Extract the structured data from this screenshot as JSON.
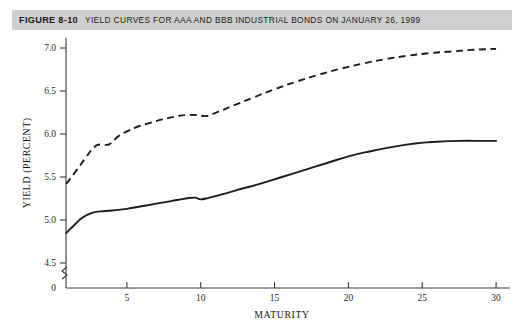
{
  "figure": {
    "number_label": "FIGURE 8-10",
    "caption": "Yield Curves for AAA and BBB Industrial Bonds on January 26, 1999",
    "band_color": "#cfcfcf",
    "background_color": "#ffffff"
  },
  "chart_data": {
    "type": "line",
    "title": "Yield Curves for AAA and BBB Industrial Bonds on January 26, 1999",
    "xlabel": "MATURITY",
    "ylabel": "YIELD (PERCENT)",
    "xlim": [
      0,
      30.6
    ],
    "ylim": [
      4.28,
      7.12
    ],
    "grid": false,
    "legend": "none",
    "axis_break": true,
    "axis_break_note": "y-axis broken between 0 and 4.5",
    "xticks": [
      5,
      10,
      15,
      20,
      25,
      30
    ],
    "xtick_labels": [
      "5",
      "10",
      "15",
      "20",
      "25",
      "30"
    ],
    "yticks": [
      4.5,
      5.0,
      5.5,
      6.0,
      6.5,
      7.0
    ],
    "ytick_labels": [
      "4.5",
      "5.0",
      "5.5",
      "6.0",
      "6.5",
      "7.0"
    ],
    "y_origin_label": "0",
    "series": [
      {
        "name": "AAA Industrial Bonds",
        "style": "solid",
        "color": "#1c1c1c",
        "x": [
          0.9,
          1.5,
          2.0,
          2.6,
          3.2,
          4.0,
          5.0,
          6.0,
          7.0,
          8.0,
          9.0,
          9.6,
          10.0,
          10.6,
          11.5,
          12.5,
          14.0,
          15.5,
          17.0,
          18.5,
          20.0,
          21.5,
          23.0,
          24.5,
          26.0,
          27.5,
          29.0,
          30.0
        ],
        "y": [
          4.85,
          4.95,
          5.03,
          5.08,
          5.1,
          5.11,
          5.13,
          5.16,
          5.19,
          5.22,
          5.25,
          5.26,
          5.24,
          5.26,
          5.3,
          5.35,
          5.42,
          5.5,
          5.58,
          5.66,
          5.74,
          5.8,
          5.85,
          5.89,
          5.91,
          5.92,
          5.92,
          5.92
        ]
      },
      {
        "name": "BBB Industrial Bonds",
        "style": "dashed",
        "color": "#1c1c1c",
        "x": [
          0.9,
          1.6,
          2.2,
          2.8,
          3.3,
          3.8,
          4.4,
          5.0,
          5.8,
          6.6,
          7.4,
          8.2,
          9.0,
          9.8,
          10.4,
          11.2,
          12.2,
          13.5,
          15.0,
          16.5,
          18.0,
          19.5,
          21.0,
          22.5,
          24.0,
          25.5,
          27.0,
          28.5,
          30.0
        ],
        "y": [
          5.42,
          5.58,
          5.72,
          5.85,
          5.88,
          5.88,
          5.97,
          6.03,
          6.09,
          6.13,
          6.17,
          6.2,
          6.22,
          6.22,
          6.21,
          6.26,
          6.33,
          6.42,
          6.52,
          6.61,
          6.69,
          6.76,
          6.82,
          6.87,
          6.91,
          6.94,
          6.96,
          6.98,
          6.99
        ]
      }
    ]
  }
}
